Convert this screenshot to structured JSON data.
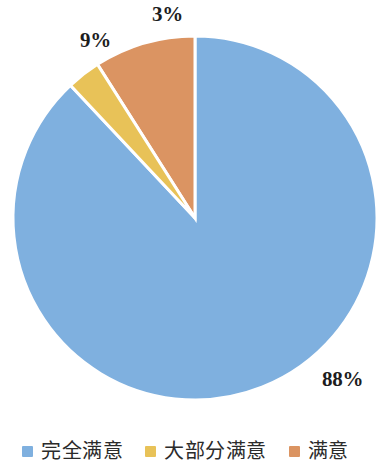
{
  "chart_data": {
    "type": "pie",
    "title": "",
    "categories": [
      "完全满意",
      "大部分满意",
      "满意"
    ],
    "values": [
      88,
      3,
      9
    ],
    "value_labels": [
      "88%",
      "3%",
      "9%"
    ],
    "colors": [
      "#7FB0DF",
      "#E8C258",
      "#DB9462"
    ],
    "start_angle_deg": 0,
    "direction": "clockwise",
    "legend_position": "bottom",
    "grid": false,
    "xlabel": "",
    "ylabel": ""
  },
  "legend": {
    "items": [
      {
        "label": "完全满意",
        "color": "#7FB0DF"
      },
      {
        "label": "大部分满意",
        "color": "#E8C258"
      },
      {
        "label": "满意",
        "color": "#DB9462"
      }
    ]
  },
  "labels": {
    "blue_pct": "88%",
    "yellow_pct": "3%",
    "orange_pct": "9%"
  }
}
